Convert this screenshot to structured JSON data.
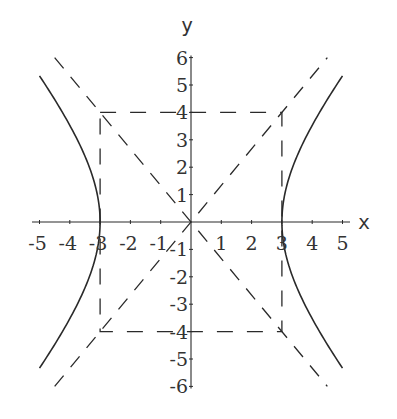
{
  "chart_data": {
    "type": "line",
    "title": "",
    "equation": "x^2/9 - y^2/16 = 1",
    "xlabel": "x",
    "ylabel": "y",
    "xlim": [
      -5.5,
      5.5
    ],
    "ylim": [
      -6,
      6
    ],
    "grid": false,
    "legend": null,
    "x_ticks": [
      -5,
      -4,
      -3,
      -2,
      -1,
      1,
      2,
      3,
      4,
      5
    ],
    "x_tick_labels": [
      "-5",
      "-4",
      "-3",
      "-2",
      "-1",
      "1",
      "2",
      "3",
      "4",
      "5"
    ],
    "y_ticks": [
      6,
      5,
      4,
      3,
      2,
      1,
      -1,
      -2,
      -3,
      -4,
      -5,
      -6
    ],
    "y_tick_labels": [
      "6",
      "5",
      "4",
      "3",
      "2",
      "1",
      "-1",
      "-2",
      "-3",
      "-4",
      "-5",
      "-6"
    ],
    "series": [
      {
        "name": "hyperbola-right-branch",
        "style": "solid",
        "a": 3,
        "b": 4,
        "x_range": [
          3,
          5
        ]
      },
      {
        "name": "hyperbola-left-branch",
        "style": "solid",
        "a": 3,
        "b": 4,
        "x_range": [
          -5,
          -3
        ]
      },
      {
        "name": "asymptote-positive",
        "style": "dashed",
        "slope": 1.3333,
        "x": [
          -4.5,
          4.5
        ],
        "y": [
          -6,
          6
        ]
      },
      {
        "name": "asymptote-negative",
        "style": "dashed",
        "slope": -1.3333,
        "x": [
          -4.5,
          4.5
        ],
        "y": [
          6,
          -6
        ]
      },
      {
        "name": "central-rectangle",
        "style": "dashed",
        "x": [
          -3,
          3
        ],
        "y": [
          -4,
          4
        ]
      }
    ]
  },
  "axes": {
    "x_label": "x",
    "y_label": "y"
  },
  "colors": {
    "stroke": "#2a2a2a",
    "text": "#333333",
    "background": "#ffffff"
  }
}
